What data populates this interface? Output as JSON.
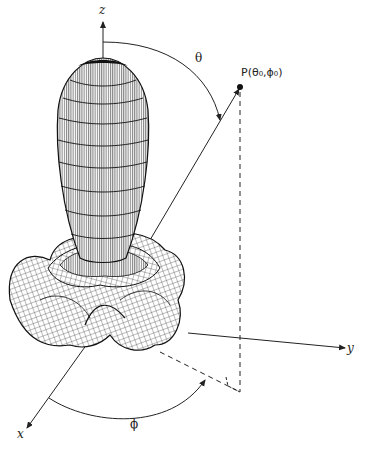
{
  "figure": {
    "type": "3D radiation pattern diagram",
    "axes": {
      "z_label": "z",
      "y_label": "y",
      "x_label": "x"
    },
    "angles": {
      "theta_label": "θ",
      "phi_label": "ϕ"
    },
    "point": {
      "label": "P(θ₀,ϕ₀)"
    },
    "colors": {
      "line": "#222222",
      "mesh": "#1a1a1a",
      "background": "#ffffff"
    }
  }
}
